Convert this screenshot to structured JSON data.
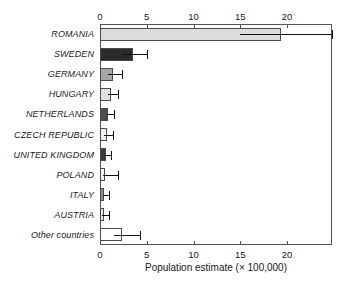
{
  "chart_data": {
    "type": "bar",
    "orientation": "horizontal",
    "title": "",
    "xlabel": "Population estimate (× 100,000)",
    "ylabel": "",
    "xlim": [
      0,
      24.8
    ],
    "xticks": [
      0,
      5,
      10,
      15,
      20
    ],
    "xtick_labels": [
      "0",
      "5",
      "10",
      "15",
      "20"
    ],
    "grid": false,
    "legend": null,
    "axis_positions": [
      "top",
      "bottom"
    ],
    "categories": [
      "ROMANIA",
      "SWEDEN",
      "GERMANY",
      "HUNGARY",
      "NETHERLANDS",
      "CZECH REPUBLIC",
      "UNITED KINGDOM",
      "POLAND",
      "ITALY",
      "AUSTRIA",
      "Other countries"
    ],
    "values": [
      19.3,
      3.5,
      1.4,
      1.2,
      0.85,
      0.7,
      0.6,
      0.5,
      0.45,
      0.4,
      2.3
    ],
    "error_low": [
      15.0,
      2.3,
      0.9,
      0.85,
      0.6,
      0.45,
      0.4,
      0.3,
      0.3,
      0.25,
      1.5
    ],
    "error_high": [
      24.8,
      5.0,
      2.4,
      1.9,
      1.5,
      1.4,
      1.2,
      1.9,
      1.0,
      1.0,
      4.3
    ],
    "bar_colors": [
      "#dcdcdc",
      "#2b2b2b",
      "#a6a6a6",
      "#e2e2e2",
      "#4e4e4e",
      "#f2f2f2",
      "#3a3a3a",
      "#fbfbfb",
      "#8e8e8e",
      "#e8e8e8",
      "#ffffff"
    ],
    "bar_edge_color": "#4a4a4a",
    "error_bar_color": "#111111",
    "axis_color": "#555555",
    "background_color": "#ffffff"
  }
}
